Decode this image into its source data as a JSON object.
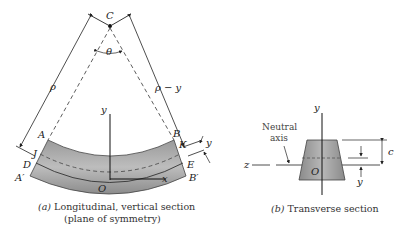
{
  "figure": {
    "left": {
      "labels": {
        "center": "C",
        "angle": "θ",
        "radius": "ρ",
        "radius_minus_y": "ρ − y",
        "y_axis": "y",
        "x_axis": "x",
        "origin": "O",
        "A": "A",
        "B": "B",
        "A_prime": "A′",
        "B_prime": "B′",
        "D": "D",
        "E": "E",
        "J": "J",
        "K": "K",
        "y_offset": "y"
      },
      "caption_prefix": "(a)",
      "caption_line1": " Longitudinal, vertical section",
      "caption_line2": "(plane of symmetry)"
    },
    "right": {
      "labels": {
        "neutral_line1": "Neutral",
        "neutral_line2": "axis",
        "z_axis": "z",
        "y_axis": "y",
        "origin": "O",
        "c_dim": "c",
        "y_dim": "y"
      },
      "caption_prefix": "(b)",
      "caption_text": " Transverse section"
    },
    "colors": {
      "band_fill": "#8a8a8a",
      "band_light": "#b5b5b5",
      "line": "#222222"
    }
  }
}
